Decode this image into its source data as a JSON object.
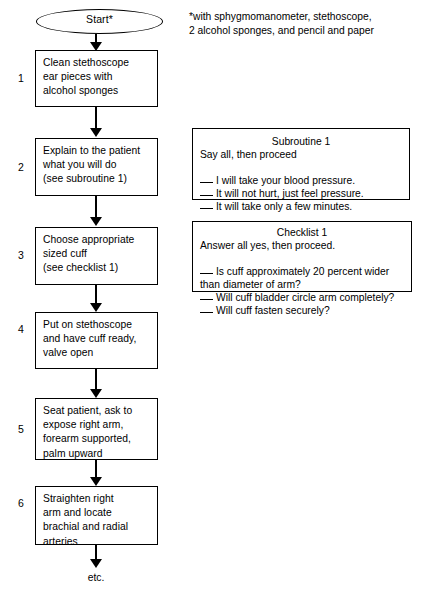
{
  "diagram": {
    "footnote": "*with sphygmomanometer, stethoscope,\n2 alcohol sponges, and pencil and paper",
    "start_label": "Start*",
    "end_label": "etc."
  },
  "steps": [
    {
      "number": "1",
      "text": "Clean stethoscope\near pieces with\nalcohol sponges"
    },
    {
      "number": "2",
      "text": "Explain to the patient\nwhat you will do\n(see subroutine 1)"
    },
    {
      "number": "3",
      "text": "Choose appropriate\nsized cuff\n(see checklist 1)"
    },
    {
      "number": "4",
      "text": "Put on stethoscope\nand have cuff ready,\nvalve open"
    },
    {
      "number": "5",
      "text": "Seat patient, ask to\nexpose right arm,\nforearm supported,\npalm upward"
    },
    {
      "number": "6",
      "text": "Straighten right\narm and locate\nbrachial and radial\narteries"
    }
  ],
  "subroutine": {
    "title": "Subroutine 1",
    "lead": "Say all, then proceed",
    "items": [
      "I will take your blood pressure.",
      "It will not hurt, just feel pressure.",
      "It will take only a few minutes."
    ]
  },
  "checklist": {
    "title": "Checklist 1",
    "lead": "Answer all yes, then proceed.",
    "items": [
      "Is cuff approximately 20 percent wider\n  than diameter of arm?",
      "Will cuff bladder circle arm completely?",
      "Will cuff fasten securely?"
    ]
  },
  "colors": {
    "background": "#ffffff",
    "ink": "#000000"
  }
}
